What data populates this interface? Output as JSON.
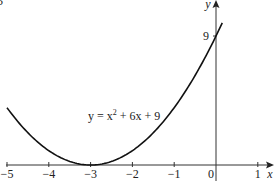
{
  "corner_mark": "5",
  "chart_data": {
    "type": "line",
    "title": "",
    "equation_label": {
      "prefix": "y = x",
      "exp": "2",
      "suffix": " + 6x + 9"
    },
    "xlabel": "x",
    "ylabel": "y",
    "x_ticks": [
      "−5",
      "−4",
      "−3",
      "−2",
      "−1",
      "0",
      "1"
    ],
    "x_tick_values": [
      -5,
      -4,
      -3,
      -2,
      -1,
      0,
      1
    ],
    "y_ticks": [
      "9"
    ],
    "y_tick_values": [
      9
    ],
    "xlim": [
      -5,
      1.3
    ],
    "ylim": [
      0,
      11
    ],
    "grid": false,
    "legend": null,
    "series": [
      {
        "name": "y = x^2 + 6x + 9",
        "function": "x^2 + 6x + 9",
        "x": [
          -5,
          -4.5,
          -4,
          -3.5,
          -3,
          -2.5,
          -2,
          -1.5,
          -1,
          -0.5,
          0,
          0.15
        ],
        "y": [
          4,
          2.25,
          1,
          0.25,
          0,
          0.25,
          1,
          2.25,
          4,
          6.25,
          9,
          9.92
        ]
      }
    ],
    "annotations": [
      {
        "text": "9",
        "at": [
          0,
          9
        ],
        "note": "y-intercept"
      },
      {
        "text": "vertex touches x-axis",
        "at": [
          -3,
          0
        ]
      }
    ]
  }
}
